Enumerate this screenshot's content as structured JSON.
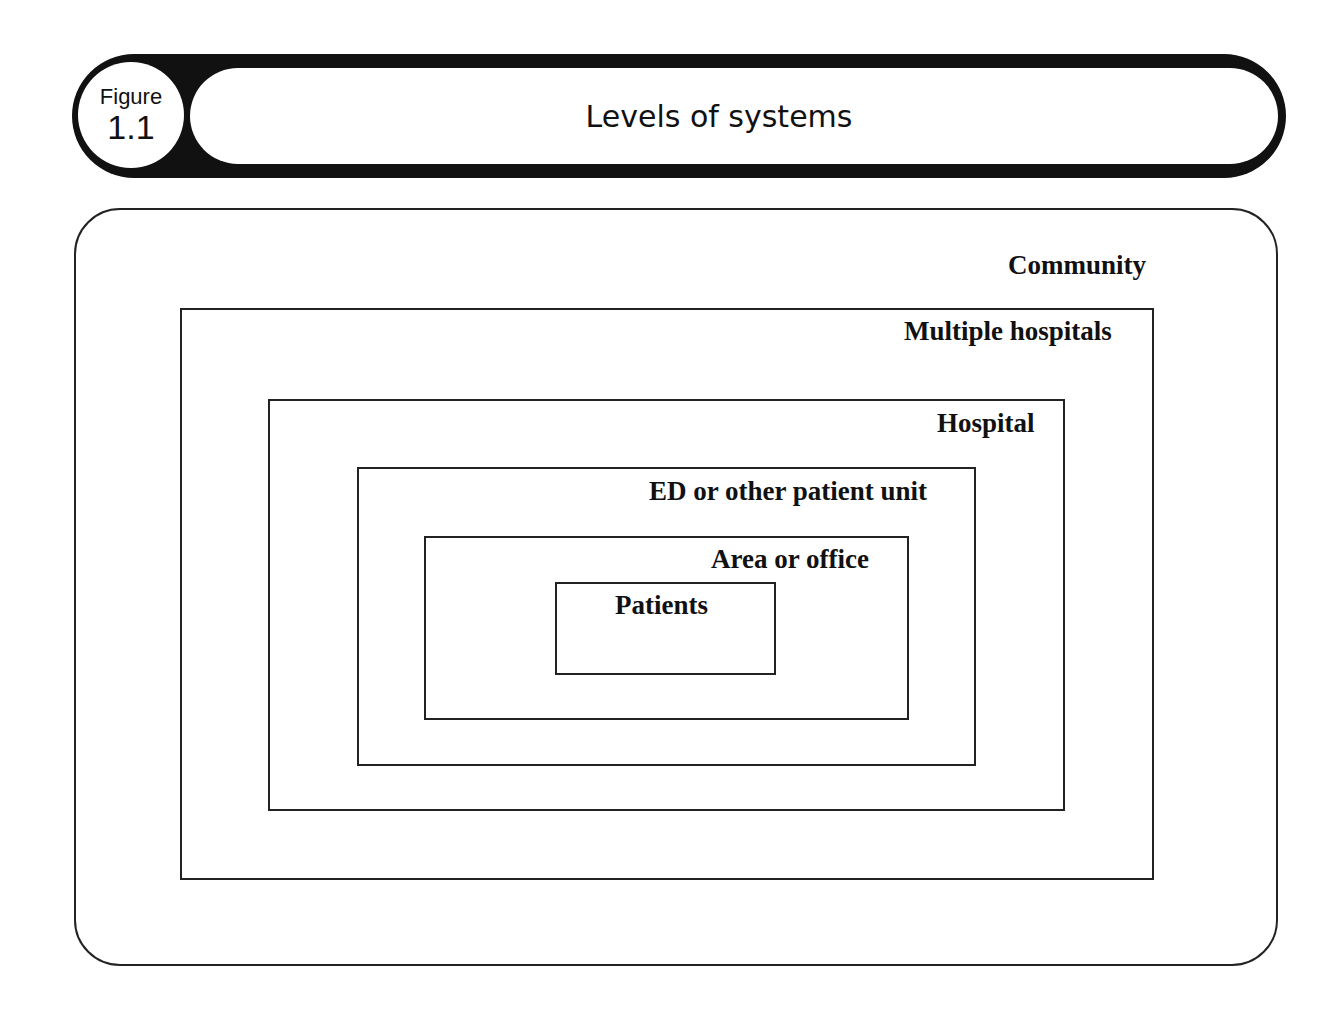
{
  "header": {
    "figure_word": "Figure",
    "figure_number": "1.1",
    "title": "Levels of systems"
  },
  "diagram": {
    "levels": [
      {
        "label": "Community"
      },
      {
        "label": "Multiple hospitals"
      },
      {
        "label": "Hospital"
      },
      {
        "label": "ED or other patient unit"
      },
      {
        "label": "Area or office"
      },
      {
        "label": "Patients"
      }
    ]
  }
}
